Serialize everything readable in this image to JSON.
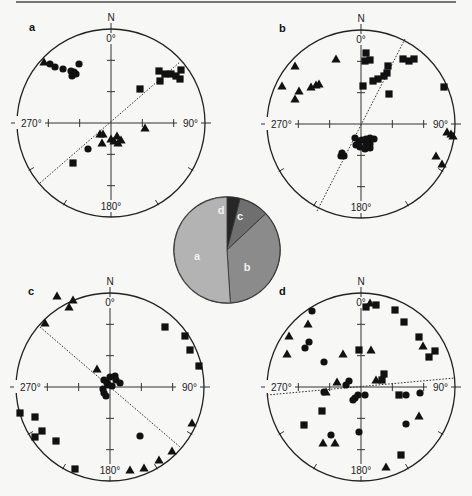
{
  "figure": {
    "width": 472,
    "height": 496,
    "top_rule": {
      "x1": 16,
      "x2": 456,
      "y": 2
    },
    "background": "#f7f7f6"
  },
  "labels": {
    "north": "N",
    "deg_0": "0°",
    "deg_90": "90°",
    "deg_180": "180°",
    "deg_270": "270°"
  },
  "chart_data": [
    {
      "type": "scatter",
      "subtype": "stereonet",
      "panel": "a",
      "center": [
        111,
        123
      ],
      "radius": 94,
      "trend_line": [
        [
          -71,
          60
        ],
        [
          69,
          -61
        ]
      ],
      "series": [
        {
          "name": "triangle",
          "points": [
            [
              -67,
              -61
            ],
            [
              34,
              5
            ],
            [
              -11,
              11
            ],
            [
              -8,
              11
            ],
            [
              -9,
              20
            ],
            [
              0,
              16
            ],
            [
              3,
              18
            ],
            [
              7,
              20
            ],
            [
              10,
              17
            ],
            [
              6,
              13
            ]
          ]
        },
        {
          "name": "circle",
          "points": [
            [
              -61,
              -59
            ],
            [
              -56,
              -56
            ],
            [
              -48,
              -54
            ],
            [
              -40,
              -52
            ],
            [
              -39,
              -47
            ],
            [
              -32,
              -59
            ],
            [
              -37,
              -51
            ],
            [
              -35,
              -49
            ],
            [
              -23,
              26
            ]
          ]
        },
        {
          "name": "square",
          "points": [
            [
              48,
              -52
            ],
            [
              54,
              -49
            ],
            [
              60,
              -49
            ],
            [
              65,
              -47
            ],
            [
              70,
              -53
            ],
            [
              69,
              -44
            ],
            [
              49,
              -42
            ],
            [
              29,
              -34
            ],
            [
              -38,
              40
            ]
          ]
        }
      ]
    },
    {
      "type": "scatter",
      "subtype": "stereonet",
      "panel": "b",
      "center": [
        361,
        124
      ],
      "radius": 94,
      "trend_line": [
        [
          -44,
          87
        ],
        [
          44,
          -85
        ]
      ],
      "series": [
        {
          "name": "triangle",
          "points": [
            [
              -66,
              -58
            ],
            [
              -25,
              -65
            ],
            [
              -79,
              -38
            ],
            [
              -62,
              -33
            ],
            [
              -50,
              -37
            ],
            [
              -45,
              -39
            ],
            [
              -42,
              -40
            ],
            [
              -66,
              -25
            ],
            [
              86,
              8
            ],
            [
              90,
              10
            ],
            [
              92,
              12
            ],
            [
              75,
              32
            ],
            [
              81,
              40
            ]
          ]
        },
        {
          "name": "circle",
          "points": [
            [
              -6,
              14
            ],
            [
              -2,
              17
            ],
            [
              1,
              16
            ],
            [
              5,
              15
            ],
            [
              9,
              14
            ],
            [
              13,
              15
            ],
            [
              5,
              19
            ],
            [
              9,
              20
            ],
            [
              -5,
              21
            ],
            [
              -1,
              23
            ],
            [
              4,
              25
            ],
            [
              9,
              24
            ],
            [
              -19,
              29
            ],
            [
              -17,
              32
            ],
            [
              -20,
              32
            ]
          ]
        },
        {
          "name": "square",
          "points": [
            [
              5,
              -71
            ],
            [
              4,
              -63
            ],
            [
              9,
              -64
            ],
            [
              27,
              -58
            ],
            [
              42,
              -65
            ],
            [
              48,
              -63
            ],
            [
              53,
              -65
            ],
            [
              26,
              -51
            ],
            [
              23,
              -48
            ],
            [
              17,
              -45
            ],
            [
              12,
              -43
            ],
            [
              2,
              -38
            ],
            [
              28,
              -30
            ],
            [
              83,
              -37
            ]
          ]
        }
      ]
    },
    {
      "type": "scatter",
      "subtype": "stereonet",
      "panel": "c",
      "center": [
        110,
        387
      ],
      "radius": 94,
      "trend_line": [
        [
          -70,
          -60
        ],
        [
          70,
          60
        ]
      ],
      "series": [
        {
          "name": "triangle",
          "points": [
            [
              -53,
              -91
            ],
            [
              -37,
              -87
            ],
            [
              -41,
              -80
            ],
            [
              -65,
              -64
            ],
            [
              -13,
              -18
            ],
            [
              82,
              36
            ],
            [
              62,
              64
            ],
            [
              49,
              73
            ],
            [
              34,
              81
            ],
            [
              20,
              83
            ]
          ]
        },
        {
          "name": "circle",
          "points": [
            [
              -6,
              -7
            ],
            [
              -3,
              -4
            ],
            [
              0,
              -10
            ],
            [
              5,
              -11
            ],
            [
              6,
              -7
            ],
            [
              10,
              -4
            ],
            [
              -2,
              -2
            ],
            [
              -7,
              2
            ],
            [
              -6,
              6
            ],
            [
              -4,
              9
            ],
            [
              2,
              -1
            ],
            [
              30,
              49
            ]
          ]
        },
        {
          "name": "square",
          "points": [
            [
              55,
              -60
            ],
            [
              75,
              -51
            ],
            [
              80,
              -37
            ],
            [
              89,
              -21
            ],
            [
              -90,
              26
            ],
            [
              -75,
              30
            ],
            [
              -68,
              44
            ],
            [
              -75,
              50
            ],
            [
              -54,
              54
            ],
            [
              -35,
              82
            ]
          ]
        }
      ]
    },
    {
      "type": "scatter",
      "subtype": "stereonet",
      "panel": "d",
      "center": [
        361,
        387
      ],
      "radius": 94,
      "trend_line": [
        [
          -94,
          8
        ],
        [
          94,
          -9
        ]
      ],
      "series": [
        {
          "name": "triangle",
          "points": [
            [
              9,
              -84
            ],
            [
              -53,
              -63
            ],
            [
              -72,
              -51
            ],
            [
              -74,
              -33
            ],
            [
              -18,
              -33
            ],
            [
              10,
              -37
            ],
            [
              62,
              -41
            ],
            [
              -24,
              -5
            ],
            [
              -35,
              5
            ],
            [
              15,
              -7
            ],
            [
              58,
              29
            ],
            [
              -38,
              56
            ],
            [
              -26,
              56
            ],
            [
              25,
              80
            ]
          ]
        },
        {
          "name": "circle",
          "points": [
            [
              -49,
              -76
            ],
            [
              -52,
              -45
            ],
            [
              -56,
              -39
            ],
            [
              -37,
              -25
            ],
            [
              -12,
              -6
            ],
            [
              -15,
              -2
            ],
            [
              -37,
              5
            ],
            [
              -3,
              8
            ],
            [
              -6,
              11
            ],
            [
              -8,
              13
            ],
            [
              4,
              8
            ],
            [
              45,
              8
            ],
            [
              59,
              6
            ],
            [
              45,
              37
            ],
            [
              -30,
              48
            ],
            [
              -2,
              45
            ]
          ]
        },
        {
          "name": "square",
          "points": [
            [
              15,
              -82
            ],
            [
              5,
              -80
            ],
            [
              34,
              -77
            ],
            [
              43,
              -65
            ],
            [
              58,
              -50
            ],
            [
              74,
              -36
            ],
            [
              68,
              -30
            ],
            [
              -2,
              -37
            ],
            [
              23,
              -13
            ],
            [
              21,
              -7
            ],
            [
              38,
              8
            ],
            [
              -39,
              24
            ],
            [
              -57,
              38
            ],
            [
              40,
              68
            ]
          ]
        }
      ]
    },
    {
      "type": "pie",
      "center": [
        227,
        250
      ],
      "radius": 53,
      "start_angle_deg": 0,
      "direction": "clockwise",
      "slices": [
        {
          "label": "d",
          "value": 4,
          "color": "#262626",
          "label_pos": [
            -6,
            -40
          ]
        },
        {
          "label": "c",
          "value": 9,
          "color": "#6f6f6f",
          "label_pos": [
            13,
            -34
          ]
        },
        {
          "label": "b",
          "value": 36,
          "color": "#8b8b8b",
          "label_pos": [
            20,
            17
          ]
        },
        {
          "label": "a",
          "value": 51,
          "color": "#b3b3b3",
          "label_pos": [
            -30,
            6
          ]
        }
      ]
    }
  ]
}
